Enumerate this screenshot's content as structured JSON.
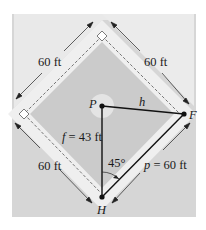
{
  "diagram": {
    "type": "softball-diamond",
    "points": {
      "pitcher": {
        "label": "P"
      },
      "first_base": {
        "label": "F"
      },
      "home": {
        "label": "H"
      },
      "h_segment": {
        "label": "h"
      }
    },
    "labels": {
      "top_left_side": "60 ft",
      "top_right_side": "60 ft",
      "bottom_left_side": "60 ft",
      "f_var": "f",
      "f_value": " = 43 ft",
      "p_var": "p",
      "p_value": " = 60 ft",
      "angle": "45°"
    },
    "colors": {
      "outfield": "#d4d4d4",
      "baseline_path": "#ececec",
      "infield": "#c8c8c8",
      "mound": "#e6e6e6",
      "ink": "#111111"
    }
  }
}
